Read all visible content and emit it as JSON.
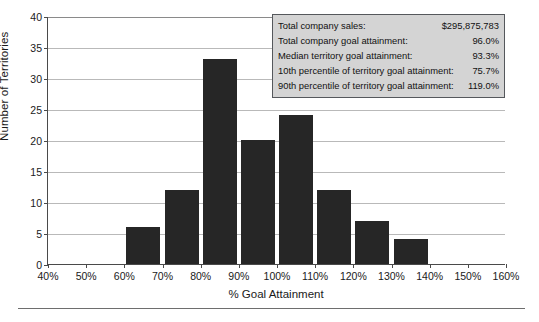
{
  "chart_data": {
    "type": "bar",
    "title": "",
    "subtitle": "",
    "xlabel": "% Goal Attainment",
    "ylabel": "Number of Territories",
    "categories": [
      "40%-50%",
      "50%-60%",
      "60%-70%",
      "70%-80%",
      "80%-90%",
      "90%-100%",
      "100%-110%",
      "110%-120%",
      "120%-130%",
      "130%-140%",
      "140%-150%",
      "150%-160%"
    ],
    "values": [
      0,
      0,
      6,
      12,
      33,
      20,
      24,
      12,
      7,
      4,
      0,
      0
    ],
    "bin_starts": [
      40,
      50,
      60,
      70,
      80,
      90,
      100,
      110,
      120,
      130,
      140,
      150
    ],
    "bin_width": 10,
    "xlim": [
      40,
      160
    ],
    "ylim": [
      0,
      40
    ],
    "x_tick_labels": [
      "40%",
      "50%",
      "60%",
      "70%",
      "80%",
      "90%",
      "100%",
      "110%",
      "120%",
      "130%",
      "140%",
      "150%",
      "160%"
    ],
    "x_tick_values": [
      40,
      50,
      60,
      70,
      80,
      90,
      100,
      110,
      120,
      130,
      140,
      150,
      160
    ],
    "y_tick_labels": [
      "0",
      "5",
      "10",
      "15",
      "20",
      "25",
      "30",
      "35",
      "40"
    ],
    "y_tick_values": [
      0,
      5,
      10,
      15,
      20,
      25,
      30,
      35,
      40
    ],
    "grid": true,
    "grid_axis": "y",
    "legend": null,
    "bar_color": "#262626",
    "annotations": []
  },
  "stats_box": {
    "background_color": "#d4d4d4",
    "border_color": "#55585c",
    "rows": [
      {
        "label": "Total company sales:",
        "value": "$295,875,783"
      },
      {
        "label": "Total company goal attainment:",
        "value": "96.0%"
      },
      {
        "label": "Median territory goal attainment:",
        "value": "93.3%"
      },
      {
        "label": "10th percentile of territory goal attainment:",
        "value": "75.7%"
      },
      {
        "label": "90th percentile of territory goal attainment:",
        "value": "119.0%"
      }
    ]
  }
}
